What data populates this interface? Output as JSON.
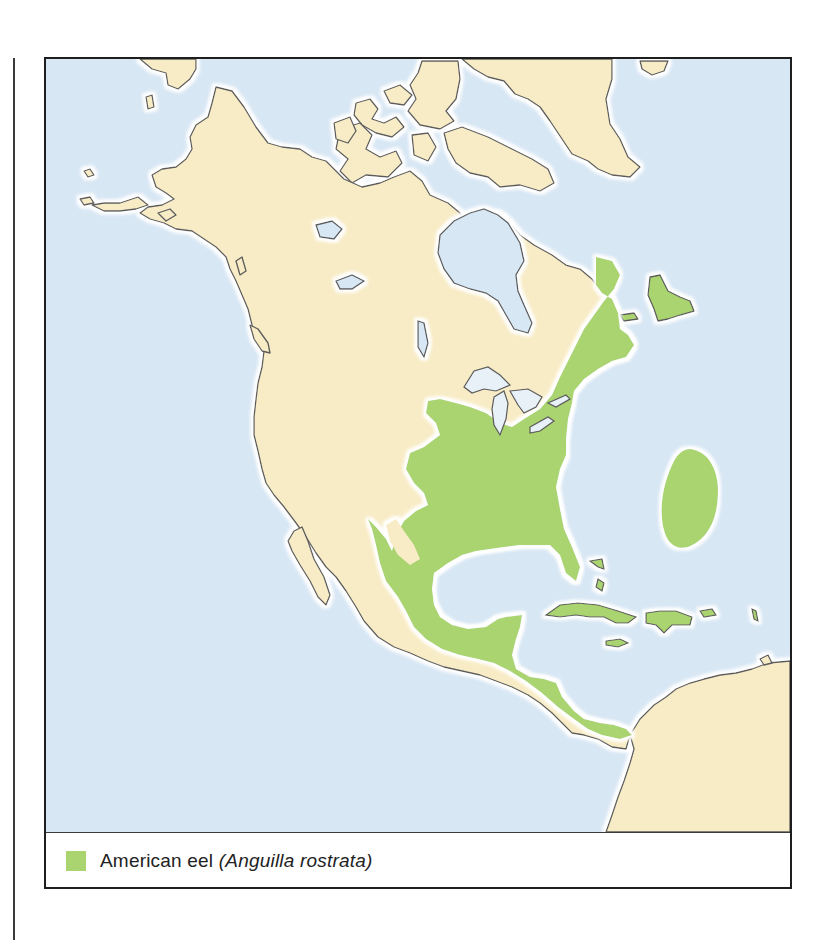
{
  "map": {
    "title": "",
    "region": "North America, Central America, Caribbean, north-western South America",
    "colors": {
      "water": "#d8e7f4",
      "land": "#f8ecc6",
      "range": "#a9d470",
      "coastline": "#5b5b5b",
      "coast_halo": "#ffffff"
    },
    "features": [
      {
        "name": "American eel range (eastern North America)",
        "type": "range"
      },
      {
        "name": "American eel range (Gulf coast, Mexico, Central America)",
        "type": "range"
      },
      {
        "name": "Sargasso Sea spawning area",
        "type": "range"
      },
      {
        "name": "Caribbean islands",
        "type": "range"
      },
      {
        "name": "Great Lakes",
        "type": "water"
      },
      {
        "name": "Hudson Bay",
        "type": "water"
      },
      {
        "name": "Greenland",
        "type": "land"
      },
      {
        "name": "Alaska",
        "type": "land"
      },
      {
        "name": "South America (Colombia/Venezuela)",
        "type": "land"
      }
    ]
  },
  "legend": {
    "items": [
      {
        "swatch_color": "#a9d470",
        "common_name": "American eel",
        "scientific_name": "(Anguilla rostrata)"
      }
    ]
  }
}
